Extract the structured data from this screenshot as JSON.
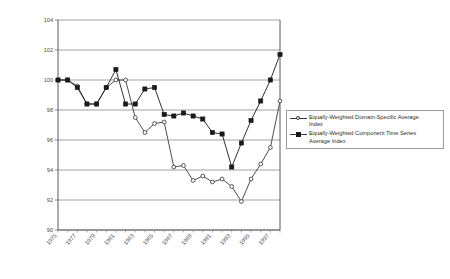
{
  "chart_data": {
    "type": "line",
    "title": "",
    "subtitle": "",
    "xlabel": "",
    "ylabel": "",
    "ylim": [
      90,
      104
    ],
    "ytick_step": 2,
    "yticks": [
      90,
      92,
      94,
      96,
      98,
      100,
      102,
      104
    ],
    "grid": true,
    "grid_axis": "y",
    "legend_position": "center-right",
    "x": [
      1975,
      1976,
      1977,
      1978,
      1979,
      1980,
      1981,
      1982,
      1983,
      1984,
      1985,
      1986,
      1987,
      1988,
      1989,
      1990,
      1991,
      1992,
      1993,
      1994,
      1995,
      1996,
      1997,
      1998
    ],
    "xtick_labels": [
      "1975",
      "1977",
      "1979",
      "1981",
      "1983",
      "1985",
      "1987",
      "1989",
      "1991",
      "1993",
      "1995",
      "1997"
    ],
    "xtick_values": [
      1975,
      1977,
      1979,
      1981,
      1983,
      1985,
      1987,
      1989,
      1991,
      1993,
      1995,
      1997
    ],
    "series": [
      {
        "name": "Equally-Weighted Domain-Specific Average Index",
        "marker": "open-circle",
        "color": "#3a3a3a",
        "values": [
          100.0,
          100.0,
          99.6,
          98.4,
          98.4,
          99.5,
          100.0,
          100.0,
          97.5,
          96.5,
          97.1,
          97.2,
          94.2,
          94.3,
          93.3,
          93.6,
          93.2,
          93.4,
          92.9,
          91.9,
          93.4,
          94.4,
          95.5,
          98.6
        ]
      },
      {
        "name": "Equally-Weighted Component Time Series Average Index",
        "marker": "filled-square",
        "color": "#1a1a1a",
        "values": [
          100.0,
          100.0,
          99.5,
          98.4,
          98.4,
          99.5,
          100.7,
          98.4,
          98.4,
          99.4,
          99.5,
          97.7,
          97.6,
          97.8,
          97.6,
          97.4,
          96.5,
          96.4,
          94.2,
          95.8,
          97.3,
          98.6,
          100.0,
          101.7
        ]
      }
    ]
  },
  "legend": {
    "items": [
      {
        "label": "Equally-Weighted Domain-Specific Average\nIndex",
        "marker": "open-circle"
      },
      {
        "label": "Equally-Weighted Component Time Series\nAverage Index",
        "marker": "filled-square"
      }
    ]
  }
}
